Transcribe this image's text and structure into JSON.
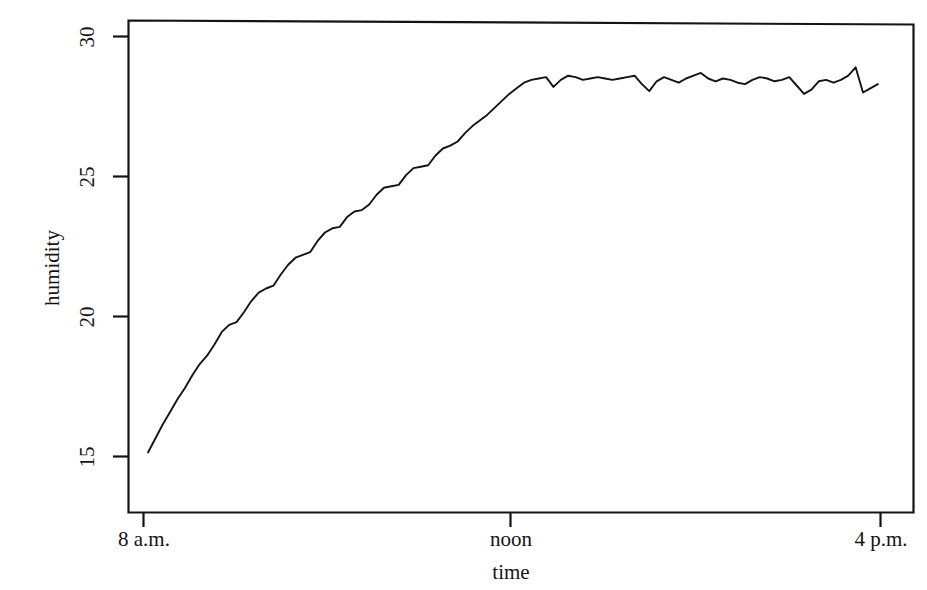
{
  "chart_data": {
    "type": "line",
    "title": "",
    "xlabel": "time",
    "ylabel": "humidity",
    "grid": false,
    "legend": "none",
    "xlim": [
      8,
      16
    ],
    "ylim": [
      14.0,
      30.6
    ],
    "x_tick_values": [
      8,
      12,
      16
    ],
    "x_tick_labels": [
      "8 a.m.",
      "noon",
      "4 p.m."
    ],
    "y_tick_values": [
      15,
      20,
      25,
      30
    ],
    "y_tick_labels": [
      "15",
      "20",
      "25",
      "30"
    ],
    "line_color": "#141414",
    "line_width": 1.8,
    "series": [
      {
        "name": "humidity",
        "x": [
          8.05,
          8.13,
          8.21,
          8.29,
          8.37,
          8.45,
          8.53,
          8.61,
          8.69,
          8.77,
          8.85,
          8.93,
          9.01,
          9.09,
          9.17,
          9.25,
          9.33,
          9.41,
          9.49,
          9.57,
          9.65,
          9.73,
          9.81,
          9.89,
          9.97,
          10.05,
          10.13,
          10.21,
          10.29,
          10.37,
          10.45,
          10.53,
          10.61,
          10.69,
          10.77,
          10.85,
          10.93,
          11.01,
          11.09,
          11.17,
          11.25,
          11.33,
          11.41,
          11.49,
          11.57,
          11.65,
          11.73,
          11.81,
          11.89,
          11.97,
          12.05,
          12.13,
          12.21,
          12.29,
          12.37,
          12.45,
          12.53,
          12.61,
          12.69,
          12.77,
          12.85,
          12.93,
          13.01,
          13.09,
          13.17,
          13.25,
          13.33,
          13.41,
          13.49,
          13.57,
          13.65,
          13.73,
          13.81,
          13.89,
          13.97,
          14.05,
          14.13,
          14.21,
          14.29,
          14.37,
          14.45,
          14.53,
          14.61,
          14.69,
          14.77,
          14.85,
          14.93,
          15.01,
          15.09,
          15.17,
          15.25,
          15.33,
          15.41,
          15.49,
          15.57,
          15.65,
          15.73,
          15.81,
          15.89,
          15.97
        ],
        "y": [
          15.15,
          15.65,
          16.15,
          16.6,
          17.05,
          17.45,
          17.9,
          18.3,
          18.6,
          19.0,
          19.45,
          19.7,
          19.8,
          20.15,
          20.55,
          20.85,
          21.0,
          21.1,
          21.5,
          21.85,
          22.1,
          22.2,
          22.3,
          22.7,
          23.0,
          23.15,
          23.2,
          23.55,
          23.75,
          23.8,
          24.0,
          24.35,
          24.6,
          24.65,
          24.7,
          25.05,
          25.3,
          25.35,
          25.4,
          25.75,
          26.0,
          26.1,
          26.25,
          26.55,
          26.8,
          27.0,
          27.2,
          27.45,
          27.7,
          27.95,
          28.15,
          28.35,
          28.45,
          28.5,
          28.55,
          28.2,
          28.45,
          28.6,
          28.55,
          28.45,
          28.5,
          28.55,
          28.5,
          28.45,
          28.5,
          28.55,
          28.6,
          28.3,
          28.05,
          28.4,
          28.55,
          28.45,
          28.35,
          28.5,
          28.6,
          28.7,
          28.5,
          28.4,
          28.5,
          28.45,
          28.35,
          28.3,
          28.45,
          28.55,
          28.5,
          28.4,
          28.45,
          28.55,
          28.25,
          27.95,
          28.1,
          28.4,
          28.45,
          28.35,
          28.45,
          28.6,
          28.9,
          28.0,
          28.15,
          28.3
        ]
      }
    ]
  },
  "axes": {
    "y_axis_title": "humidity",
    "x_axis_title": "time"
  }
}
